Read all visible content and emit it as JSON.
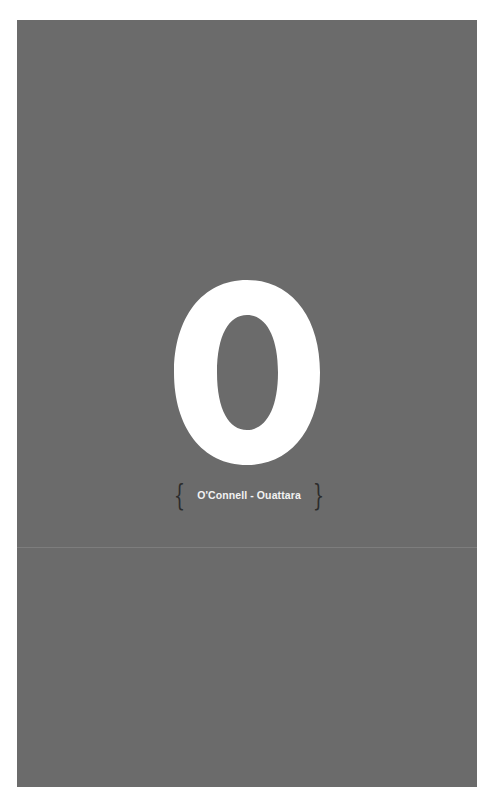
{
  "page": {
    "background_color": "#6b6b6b",
    "letter_color": "#ffffff"
  },
  "index_tab": {
    "letter": "O",
    "range_label": "O'Connell - Ouattara",
    "open_brace": "{",
    "close_brace": "}"
  }
}
